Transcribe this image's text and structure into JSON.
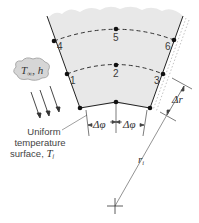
{
  "diagram": {
    "nodes": [
      {
        "id": "1",
        "label": "1"
      },
      {
        "id": "2",
        "label": "2"
      },
      {
        "id": "3",
        "label": "3"
      },
      {
        "id": "4",
        "label": "4"
      },
      {
        "id": "5",
        "label": "5"
      },
      {
        "id": "6",
        "label": "6"
      }
    ],
    "convection": {
      "label_T": "T",
      "label_sub": "∞",
      "label_h": ", h"
    },
    "surface_caption": [
      "Uniform",
      "temperature",
      "surface, "
    ],
    "surface_temp_symbol": "T",
    "surface_temp_sub": "i",
    "delta_phi": "Δφ",
    "delta_r": "Δr",
    "radius": "r",
    "radius_sub": "i",
    "colors": {
      "fill": "#e8e8e8",
      "line": "#222222",
      "dim": "#555555"
    }
  }
}
